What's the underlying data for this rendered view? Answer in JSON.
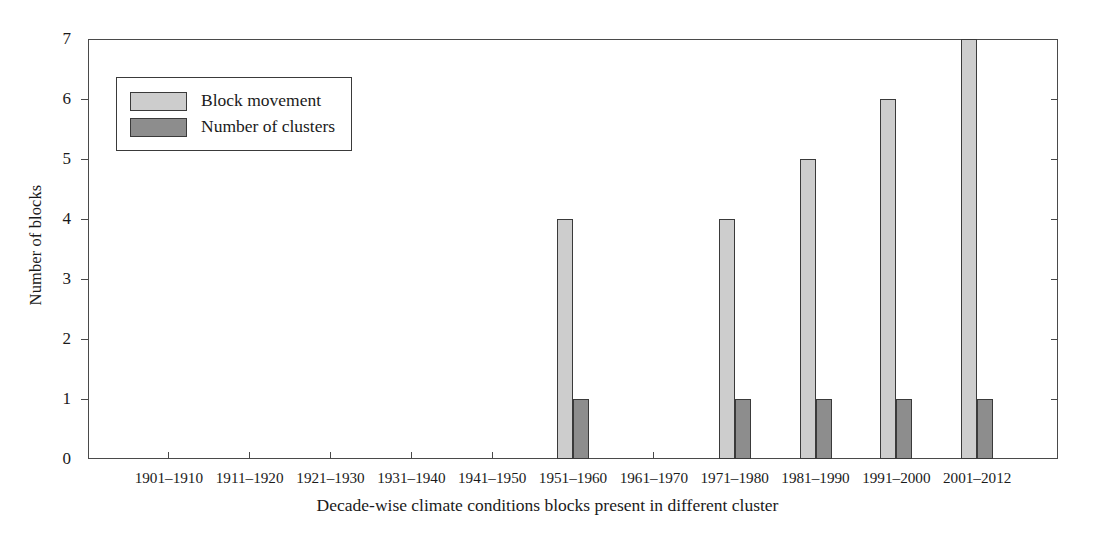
{
  "chart_data": {
    "type": "bar",
    "title": "",
    "xlabel": "Decade-wise climate conditions blocks present in different cluster",
    "ylabel": "Number of blocks",
    "categories": [
      "1901–1910",
      "1911–1920",
      "1921–1930",
      "1931–1940",
      "1941–1950",
      "1951–1960",
      "1961–1970",
      "1971–1980",
      "1981–1990",
      "1991–2000",
      "2001–2012"
    ],
    "series": [
      {
        "name": "Block movement",
        "color": "#cdcdcd",
        "values": [
          0,
          0,
          0,
          0,
          0,
          4,
          0,
          4,
          5,
          6,
          7
        ]
      },
      {
        "name": "Number of clusters",
        "color": "#8d8d8d",
        "values": [
          0,
          0,
          0,
          0,
          0,
          1,
          0,
          1,
          1,
          1,
          1
        ]
      }
    ],
    "ylim": [
      0,
      7
    ],
    "yticks": [
      "0",
      "1",
      "2",
      "3",
      "4",
      "5",
      "6",
      "7"
    ],
    "grid": false,
    "legend_position": "top-left"
  },
  "legend": {
    "entries": [
      {
        "label": "Block movement"
      },
      {
        "label": "Number of clusters"
      }
    ]
  }
}
